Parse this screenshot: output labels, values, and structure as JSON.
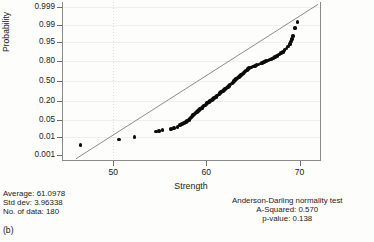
{
  "figure": {
    "panel_label": "(b)",
    "x_axis_title": "Strength",
    "y_axis_title": "Probability"
  },
  "stats_left": {
    "average_line": "Average: 61.0978",
    "stddev_line": "Std dev: 3.96338",
    "count_line": "No. of data: 180"
  },
  "stats_right": {
    "test_name": "Anderson-Darling normality test",
    "a_squared_line": "A-Squared: 0.570",
    "p_value_line": "p-value: 0.138"
  },
  "chart_data": {
    "type": "scatter",
    "title": "",
    "subtitle": "",
    "xlabel": "Strength",
    "ylabel": "Probability",
    "xlim": [
      44.5,
      72.2
    ],
    "ylim_probability": [
      0.0005,
      0.9995
    ],
    "grid": true,
    "legend_position": "none",
    "x_ticks": [
      50,
      60,
      70
    ],
    "x_tick_labels": [
      "50",
      "60",
      "70"
    ],
    "y_ticks": [
      0.001,
      0.01,
      0.05,
      0.2,
      0.5,
      0.8,
      0.95,
      0.99,
      0.999
    ],
    "y_tick_labels": [
      "0.001",
      "0.01",
      "0.05",
      "0.20",
      "0.50",
      "0.80",
      "0.95",
      "0.99",
      "0.999"
    ],
    "y_scale": "normal-probability",
    "annotations": [
      "Average: 61.0978",
      "Std dev: 3.96338",
      "No. of data: 180",
      "Anderson-Darling normality test",
      "A-Squared: 0.570",
      "p-value: 0.138"
    ],
    "fit_line": {
      "name": "normal fit line",
      "x_start": 46.0,
      "x_end": 72.0,
      "p_start": 0.0006,
      "p_end": 0.9993,
      "mean": 61.0978,
      "sd": 3.96338
    },
    "series": [
      {
        "name": "ordered observations",
        "n": 180,
        "points": [
          {
            "x": 46.5,
            "p": 0.004
          },
          {
            "x": 50.6,
            "p": 0.0075
          },
          {
            "x": 52.3,
            "p": 0.0095
          },
          {
            "x": 54.6,
            "p": 0.0175
          },
          {
            "x": 54.9,
            "p": 0.0185
          },
          {
            "x": 55.3,
            "p": 0.02
          },
          {
            "x": 56.2,
            "p": 0.0225
          },
          {
            "x": 56.5,
            "p": 0.025
          },
          {
            "x": 56.9,
            "p": 0.028
          },
          {
            "x": 57.2,
            "p": 0.033
          },
          {
            "x": 57.4,
            "p": 0.036
          },
          {
            "x": 57.6,
            "p": 0.04
          },
          {
            "x": 57.8,
            "p": 0.044
          },
          {
            "x": 57.9,
            "p": 0.048
          },
          {
            "x": 58.1,
            "p": 0.053
          },
          {
            "x": 58.2,
            "p": 0.057
          },
          {
            "x": 58.3,
            "p": 0.062
          },
          {
            "x": 58.4,
            "p": 0.067
          },
          {
            "x": 58.5,
            "p": 0.072
          },
          {
            "x": 58.6,
            "p": 0.077
          },
          {
            "x": 58.7,
            "p": 0.082
          },
          {
            "x": 58.8,
            "p": 0.088
          },
          {
            "x": 58.9,
            "p": 0.094
          },
          {
            "x": 59.0,
            "p": 0.1
          },
          {
            "x": 59.1,
            "p": 0.106
          },
          {
            "x": 59.2,
            "p": 0.112
          },
          {
            "x": 59.3,
            "p": 0.119
          },
          {
            "x": 59.4,
            "p": 0.125
          },
          {
            "x": 59.5,
            "p": 0.132
          },
          {
            "x": 59.6,
            "p": 0.139
          },
          {
            "x": 59.7,
            "p": 0.146
          },
          {
            "x": 59.8,
            "p": 0.153
          },
          {
            "x": 59.9,
            "p": 0.16
          },
          {
            "x": 60.0,
            "p": 0.168
          },
          {
            "x": 60.1,
            "p": 0.176
          },
          {
            "x": 60.2,
            "p": 0.184
          },
          {
            "x": 60.3,
            "p": 0.192
          },
          {
            "x": 60.4,
            "p": 0.2
          },
          {
            "x": 60.5,
            "p": 0.209
          },
          {
            "x": 60.6,
            "p": 0.218
          },
          {
            "x": 60.7,
            "p": 0.227
          },
          {
            "x": 60.8,
            "p": 0.236
          },
          {
            "x": 60.9,
            "p": 0.245
          },
          {
            "x": 61.0,
            "p": 0.255
          },
          {
            "x": 61.1,
            "p": 0.265
          },
          {
            "x": 61.2,
            "p": 0.275
          },
          {
            "x": 61.3,
            "p": 0.286
          },
          {
            "x": 61.4,
            "p": 0.297
          },
          {
            "x": 61.5,
            "p": 0.308
          },
          {
            "x": 61.6,
            "p": 0.319
          },
          {
            "x": 61.7,
            "p": 0.33
          },
          {
            "x": 61.8,
            "p": 0.342
          },
          {
            "x": 61.9,
            "p": 0.354
          },
          {
            "x": 62.0,
            "p": 0.366
          },
          {
            "x": 62.1,
            "p": 0.378
          },
          {
            "x": 62.2,
            "p": 0.391
          },
          {
            "x": 62.3,
            "p": 0.404
          },
          {
            "x": 62.4,
            "p": 0.417
          },
          {
            "x": 62.5,
            "p": 0.43
          },
          {
            "x": 62.6,
            "p": 0.443
          },
          {
            "x": 62.7,
            "p": 0.457
          },
          {
            "x": 62.8,
            "p": 0.471
          },
          {
            "x": 62.9,
            "p": 0.485
          },
          {
            "x": 63.0,
            "p": 0.5
          },
          {
            "x": 63.1,
            "p": 0.515
          },
          {
            "x": 63.2,
            "p": 0.529
          },
          {
            "x": 63.3,
            "p": 0.543
          },
          {
            "x": 63.4,
            "p": 0.557
          },
          {
            "x": 63.5,
            "p": 0.57
          },
          {
            "x": 63.6,
            "p": 0.583
          },
          {
            "x": 63.7,
            "p": 0.596
          },
          {
            "x": 63.8,
            "p": 0.609
          },
          {
            "x": 63.9,
            "p": 0.622
          },
          {
            "x": 64.0,
            "p": 0.634
          },
          {
            "x": 64.1,
            "p": 0.646
          },
          {
            "x": 64.2,
            "p": 0.658
          },
          {
            "x": 64.3,
            "p": 0.67
          },
          {
            "x": 64.4,
            "p": 0.681
          },
          {
            "x": 64.5,
            "p": 0.692
          },
          {
            "x": 64.6,
            "p": 0.703
          },
          {
            "x": 64.8,
            "p": 0.714
          },
          {
            "x": 65.0,
            "p": 0.725
          },
          {
            "x": 65.2,
            "p": 0.736
          },
          {
            "x": 65.4,
            "p": 0.746
          },
          {
            "x": 65.6,
            "p": 0.756
          },
          {
            "x": 65.8,
            "p": 0.766
          },
          {
            "x": 66.0,
            "p": 0.776
          },
          {
            "x": 66.2,
            "p": 0.785
          },
          {
            "x": 66.4,
            "p": 0.795
          },
          {
            "x": 66.6,
            "p": 0.804
          },
          {
            "x": 66.8,
            "p": 0.813
          },
          {
            "x": 67.0,
            "p": 0.822
          },
          {
            "x": 67.2,
            "p": 0.832
          },
          {
            "x": 67.4,
            "p": 0.842
          },
          {
            "x": 67.6,
            "p": 0.853
          },
          {
            "x": 67.8,
            "p": 0.864
          },
          {
            "x": 68.0,
            "p": 0.876
          },
          {
            "x": 68.2,
            "p": 0.888
          },
          {
            "x": 68.4,
            "p": 0.9
          },
          {
            "x": 68.6,
            "p": 0.912
          },
          {
            "x": 68.8,
            "p": 0.925
          },
          {
            "x": 69.0,
            "p": 0.94
          },
          {
            "x": 69.1,
            "p": 0.95
          },
          {
            "x": 69.2,
            "p": 0.96
          },
          {
            "x": 69.3,
            "p": 0.97
          },
          {
            "x": 69.5,
            "p": 0.986
          },
          {
            "x": 69.8,
            "p": 0.993
          }
        ]
      }
    ]
  }
}
